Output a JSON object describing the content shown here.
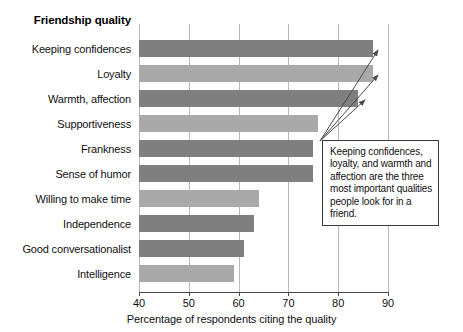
{
  "chart_data": {
    "type": "bar",
    "orientation": "horizontal",
    "title": "",
    "ylabel": "Friendship quality",
    "xlabel": "Percentage of respondents citing the quality",
    "xlim": [
      40,
      90
    ],
    "xticks": [
      40,
      50,
      60,
      70,
      80,
      90
    ],
    "grid": true,
    "legend": "none",
    "categories": [
      "Keeping confidences",
      "Loyalty",
      "Warmth, affection",
      "Supportiveness",
      "Frankness",
      "Sense of humor",
      "Willing to make time",
      "Independence",
      "Good conversationalist",
      "Intelligence"
    ],
    "values": [
      87,
      87,
      84,
      76,
      75,
      75,
      64,
      63,
      61,
      59
    ],
    "bar_colors": [
      "#7f7f7f",
      "#a9a9a9",
      "#7f7f7f",
      "#a9a9a9",
      "#7f7f7f",
      "#7f7f7f",
      "#a9a9a9",
      "#7f7f7f",
      "#7f7f7f",
      "#a9a9a9"
    ],
    "annotations": [
      {
        "text": "Keeping confidences, loyalty, and warmth and affection are the three most important qualities people look for in a friend.",
        "points_to": [
          "Keeping confidences",
          "Loyalty",
          "Warmth, affection"
        ]
      }
    ]
  },
  "colors": {
    "bar_dark": "#7f7f7f",
    "bar_light": "#a9a9a9",
    "gridline": "#b9b9b9",
    "axis": "#4a4a4a",
    "callout_border": "#3a3a3a",
    "background": "#ffffff"
  }
}
